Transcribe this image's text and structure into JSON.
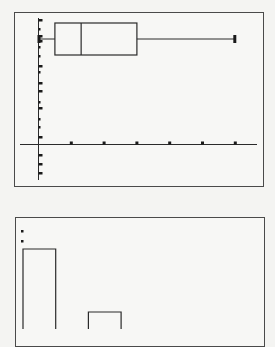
{
  "chart_data": [
    {
      "type": "box",
      "title": "",
      "xlabel": "",
      "ylabel": "",
      "x_axis": {
        "tick_values": [
          1,
          2,
          3,
          4,
          5,
          6
        ],
        "tick_labels": []
      },
      "grid": false,
      "series": [
        {
          "name": "Plot1",
          "min": 0,
          "q1": 0.5,
          "median": 1.3,
          "q3": 3.0,
          "max": 6.0
        }
      ],
      "colors": {
        "line": "#2a2a2a",
        "frame": "#4a4a4a",
        "background": "#f7f7f5"
      }
    },
    {
      "type": "bar",
      "subtype": "histogram",
      "title": "",
      "xlabel": "",
      "ylabel": "",
      "bins": [
        "bin1",
        "bin2",
        "bin3"
      ],
      "relative_heights": [
        1.0,
        0.0,
        0.0
      ],
      "note": "Bars extend below visible crop; only top edges visible. Bar 1 top higher than bar 3 top.",
      "visible_bars": [
        {
          "bin_index": 0,
          "top_px": 249
        },
        {
          "bin_index": 2,
          "top_px": 312
        }
      ],
      "indicator_dots": 2
    }
  ]
}
